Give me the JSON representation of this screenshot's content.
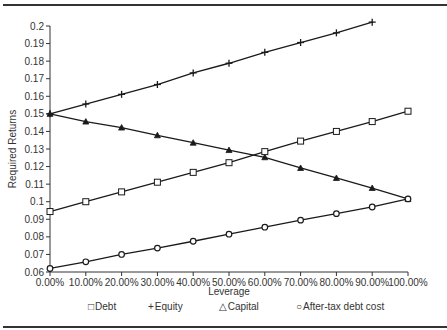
{
  "chart_data": {
    "type": "line",
    "title": "",
    "xlabel": "Leverage",
    "ylabel": "Required Returns",
    "x": [
      0,
      10,
      20,
      30,
      40,
      50,
      60,
      70,
      80,
      90,
      100
    ],
    "x_tick_labels": [
      "0.00%",
      "10.00%",
      "20.00%",
      "30.00%",
      "40.00%",
      "50.00%",
      "60.00%",
      "70.00%",
      "80.00%",
      "90.00%",
      "100.00%"
    ],
    "y_tick_labels": [
      "0.06",
      "0.07",
      "0.08",
      "0.09",
      "0.1",
      "0.11",
      "0.12",
      "0.13",
      "0.14",
      "0.15",
      "0.16",
      "0.17",
      "0.18",
      "0.19",
      "0.2"
    ],
    "ylim": [
      0.06,
      0.2
    ],
    "xlim": [
      0,
      100
    ],
    "grid": false,
    "legend_position": "bottom",
    "series": [
      {
        "name": "Debt",
        "marker": "square",
        "symbol": "□",
        "values": [
          0.0944,
          0.1,
          0.1056,
          0.1111,
          0.1167,
          0.1222,
          0.1285,
          0.1345,
          0.14,
          0.1456,
          0.1515
        ]
      },
      {
        "name": "Equity",
        "marker": "plus",
        "symbol": "+",
        "values": [
          0.15,
          0.1556,
          0.1611,
          0.1667,
          0.1733,
          0.1788,
          0.185,
          0.1906,
          0.1961,
          0.2022,
          null
        ]
      },
      {
        "name": "Capital",
        "marker": "triangle",
        "symbol": "△",
        "values": [
          0.15,
          0.1456,
          0.1422,
          0.1378,
          0.1336,
          0.1294,
          0.1253,
          0.1192,
          0.1135,
          0.1078,
          0.1016
        ]
      },
      {
        "name": "After-tax debt cost",
        "marker": "circle",
        "symbol": "○",
        "values": [
          0.062,
          0.0658,
          0.07,
          0.0736,
          0.0775,
          0.0815,
          0.0855,
          0.0895,
          0.0932,
          0.097,
          0.1016
        ]
      }
    ]
  },
  "legend": {
    "items": [
      {
        "symbol": "□",
        "label": "Debt"
      },
      {
        "symbol": "+",
        "label": "Equity"
      },
      {
        "symbol": "△",
        "label": "Capital"
      },
      {
        "symbol": "○",
        "label": "After-tax debt cost"
      }
    ]
  },
  "colors": {
    "line": "#1a1a1a",
    "axis": "#333333",
    "rule": "#333333",
    "background": "#ffffff"
  }
}
